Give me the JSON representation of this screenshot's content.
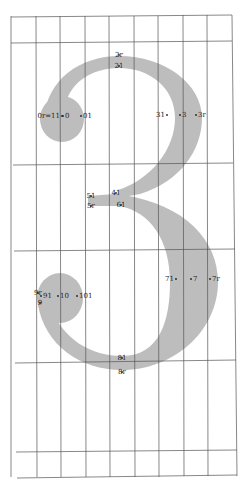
{
  "figure": {
    "glyph": "3",
    "colors": {
      "glyph_fill": "#bdbdbd",
      "grid_line": "#555555",
      "label": "#222222",
      "background": "#ffffff"
    },
    "grid": {
      "vertical_x": [
        11,
        36,
        60,
        85,
        109,
        134,
        158,
        183,
        207,
        232
      ],
      "horizontal_y": [
        16,
        42,
        164,
        251,
        362,
        452,
        477
      ]
    },
    "points": [
      {
        "id": "p0r11",
        "label": "0r=11",
        "x": 60,
        "y": 118,
        "anchor": "end"
      },
      {
        "id": "p0",
        "label": "0",
        "x": 65,
        "y": 118,
        "anchor": "start"
      },
      {
        "id": "p01",
        "label": "01",
        "x": 83,
        "y": 118,
        "anchor": "start"
      },
      {
        "id": "p2r",
        "label": "2r",
        "x": 119,
        "y": 57,
        "anchor": "middle"
      },
      {
        "id": "p21",
        "label": "21",
        "x": 119,
        "y": 68,
        "anchor": "middle"
      },
      {
        "id": "p31",
        "label": "31",
        "x": 165,
        "y": 117,
        "anchor": "end"
      },
      {
        "id": "p3",
        "label": "3",
        "x": 182,
        "y": 117,
        "anchor": "start"
      },
      {
        "id": "p3r",
        "label": "3r",
        "x": 198,
        "y": 117,
        "anchor": "start"
      },
      {
        "id": "p51",
        "label": "51",
        "x": 91,
        "y": 198,
        "anchor": "middle"
      },
      {
        "id": "p5r",
        "label": "5r",
        "x": 91,
        "y": 208,
        "anchor": "middle"
      },
      {
        "id": "p41",
        "label": "41",
        "x": 116,
        "y": 195,
        "anchor": "middle"
      },
      {
        "id": "p61",
        "label": "61",
        "x": 121,
        "y": 207,
        "anchor": "middle"
      },
      {
        "id": "p71",
        "label": "71",
        "x": 174,
        "y": 281,
        "anchor": "end"
      },
      {
        "id": "p7",
        "label": "7",
        "x": 193,
        "y": 281,
        "anchor": "start"
      },
      {
        "id": "p7r",
        "label": "7r",
        "x": 212,
        "y": 281,
        "anchor": "start"
      },
      {
        "id": "p9r",
        "label": "9r",
        "x": 38,
        "y": 295,
        "anchor": "middle"
      },
      {
        "id": "p9",
        "label": "9",
        "x": 40,
        "y": 305,
        "anchor": "middle"
      },
      {
        "id": "p91",
        "label": "91",
        "x": 43,
        "y": 298,
        "anchor": "start"
      },
      {
        "id": "p10",
        "label": "10",
        "x": 60,
        "y": 298,
        "anchor": "start"
      },
      {
        "id": "p101",
        "label": "101",
        "x": 79,
        "y": 298,
        "anchor": "start"
      },
      {
        "id": "p81",
        "label": "81",
        "x": 122,
        "y": 360,
        "anchor": "middle"
      },
      {
        "id": "p8r",
        "label": "8r",
        "x": 122,
        "y": 374,
        "anchor": "middle"
      }
    ]
  }
}
